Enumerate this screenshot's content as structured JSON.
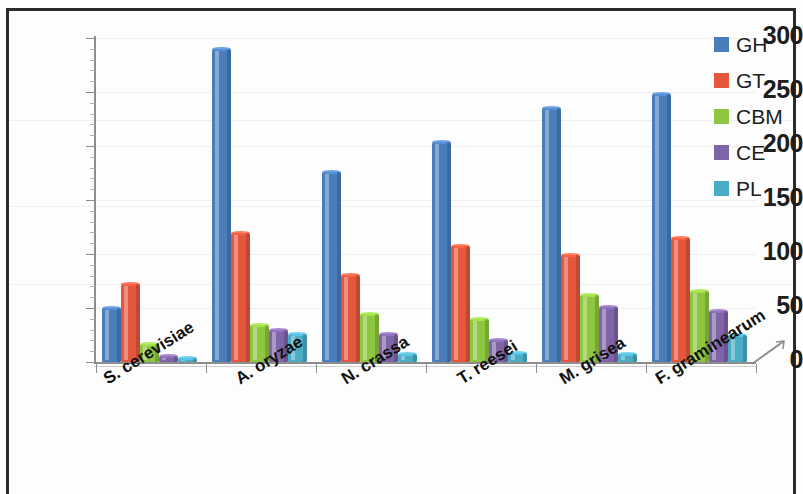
{
  "chart_data": {
    "type": "bar",
    "title": "",
    "subtitle": "",
    "xlabel": "",
    "ylabel": "",
    "ylim": [
      0,
      300
    ],
    "yticks": [
      0,
      50,
      100,
      150,
      200,
      250,
      300
    ],
    "grid": true,
    "legend_position": "right",
    "grouping": "grouped",
    "categories": [
      "S. cerevisiae",
      "A. oryzae",
      "N. crassa",
      "T. reesei",
      "M. grisea",
      "F. graminearum"
    ],
    "series": [
      {
        "name": "GH",
        "color": "#4a7ebb",
        "values": [
          50,
          290,
          176,
          204,
          235,
          248
        ]
      },
      {
        "name": "GT",
        "color": "#e4573c",
        "values": [
          72,
          119,
          81,
          107,
          99,
          115
        ]
      },
      {
        "name": "CBM",
        "color": "#8ec641",
        "values": [
          17,
          34,
          44,
          40,
          62,
          66
        ]
      },
      {
        "name": "CE",
        "color": "#8064a8",
        "values": [
          6,
          30,
          26,
          20,
          51,
          47
        ]
      },
      {
        "name": "PL",
        "color": "#4bacc6",
        "values": [
          4,
          26,
          7,
          8,
          7,
          25
        ]
      }
    ]
  },
  "legend": {
    "items": [
      {
        "label": "GH",
        "color": "#4a7ebb"
      },
      {
        "label": "GT",
        "color": "#e4573c"
      },
      {
        "label": "CBM",
        "color": "#8ec641"
      },
      {
        "label": "CE",
        "color": "#8064a8"
      },
      {
        "label": "PL",
        "color": "#4bacc6"
      }
    ]
  },
  "axes": {
    "y_tick_labels": [
      "300",
      "250",
      "200",
      "150",
      "100",
      "50",
      "0"
    ],
    "x_tick_labels": [
      "S. cerevisiae",
      "A. oryzae",
      "N. crassa",
      "T. reesei",
      "M. grisea",
      "F. graminearum"
    ]
  }
}
